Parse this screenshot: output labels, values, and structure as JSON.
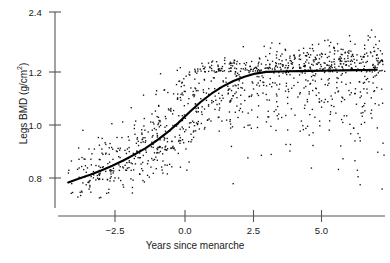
{
  "chart_data": {
    "type": "scatter",
    "title": "",
    "subtitle": "",
    "xlabel": "Years since menarche",
    "ylabel": "Legs BMD (g/cm2)",
    "ylabel_base": "Legs BMD (g/cm",
    "ylabel_sup": "2",
    "ylabel_tail": ")",
    "grid": false,
    "legend": "none",
    "xlim": [
      -4.3,
      7.3
    ],
    "ylim": [
      0.72,
      2.45
    ],
    "y_scale": "nonlinear-compressed",
    "xticks": [
      -2.5,
      0.0,
      2.5,
      5.0
    ],
    "xtick_labels": [
      "−2.5",
      "0.0",
      "2.5",
      "5.0"
    ],
    "yticks": [
      0.8,
      1.0,
      1.2,
      2.4
    ],
    "ytick_labels": [
      "0.8",
      "1.0",
      "1.2",
      "2.4"
    ],
    "point_color": "#111111",
    "line_color": "#000000",
    "axis_color": "#555555",
    "n_points": 1180,
    "series": [
      {
        "name": "Individual measurements",
        "type": "scatter",
        "marker": "dot",
        "size": 1.3,
        "description": "Legs bone mineral density of individual girls plotted against years since menarche; spread widens with increasing years."
      },
      {
        "name": "Smoothed mean curve",
        "type": "line",
        "description": "LOESS/spline fit rising from about 0.78 g/cm2 at -4.2 years, passing near 1.0 g/cm2 at 0 years, and plateauing near 1.25 g/cm2 beyond +4 years.",
        "x": [
          -4.2,
          -3.8,
          -3.4,
          -3.0,
          -2.6,
          -2.2,
          -1.8,
          -1.4,
          -1.0,
          -0.6,
          -0.2,
          0.2,
          0.6,
          1.0,
          1.4,
          1.8,
          2.2,
          2.6,
          3.0,
          3.4,
          3.8,
          4.2,
          4.6,
          5.0,
          5.4,
          5.8,
          6.2,
          6.6,
          7.0
        ],
        "y": [
          0.783,
          0.798,
          0.812,
          0.828,
          0.846,
          0.866,
          0.888,
          0.912,
          0.94,
          0.972,
          1.008,
          1.048,
          1.086,
          1.118,
          1.145,
          1.166,
          1.182,
          1.194,
          1.203,
          1.209,
          1.214,
          1.218,
          1.222,
          1.226,
          1.23,
          1.233,
          1.237,
          1.241,
          1.245
        ]
      }
    ],
    "points_note": "Dense cloud: ~1180 dots, tightest near x=-4 (y 0.74-0.86), widest near x=+3 (y 0.95-2.4)."
  },
  "figure": {
    "xtick_positions_px": [
      115,
      185,
      253.5,
      321.5
    ],
    "ytick_positions_px": [
      178,
      125,
      72,
      12
    ],
    "axis": {
      "x_line_y": 216,
      "x_line_x0": 58,
      "x_line_x1": 385,
      "y_line_x": 55,
      "y_line_y0": 12,
      "y_line_y1": 208
    }
  }
}
